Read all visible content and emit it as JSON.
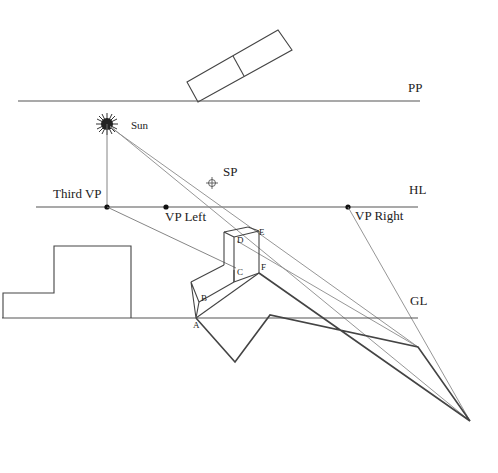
{
  "diagram": {
    "labels": {
      "picture_plane": "PP",
      "horizon_line": "HL",
      "ground_line": "GL",
      "sun": "Sun",
      "station_point": "SP",
      "third_vp": "Third VP",
      "vp_left": "VP Left",
      "vp_right": "VP Right"
    },
    "points": {
      "A": "A",
      "B": "B",
      "C": "C",
      "D": "D",
      "E": "E",
      "F": "F"
    },
    "icons": {
      "sun": "sun-icon",
      "station_point": "crosshair-icon"
    },
    "colors": {
      "background": "#ffffff",
      "lines": "#555555",
      "rays": "#8a8a8a",
      "shadow_outline": "#444444",
      "sun_fill": "#222222"
    }
  }
}
